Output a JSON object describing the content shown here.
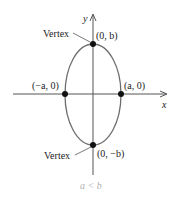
{
  "diagram": {
    "type": "ellipse-vertical-major-axis",
    "axes": {
      "x_label": "x",
      "y_label": "y"
    },
    "ellipse": {
      "stroke_color": "#6e6e6e"
    },
    "points": [
      {
        "id": "top",
        "label": "(0, b)"
      },
      {
        "id": "bottom",
        "label": "(0, −b)"
      },
      {
        "id": "left",
        "label": "(−a, 0)"
      },
      {
        "id": "right",
        "label": "(a, 0)"
      }
    ],
    "vertex_labels": {
      "top": "Vertex",
      "bottom": "Vertex"
    },
    "caption": "a < b",
    "colors": {
      "axis": "#555555",
      "point": "#111111",
      "text": "#222222",
      "caption": "#b0b0b0"
    }
  }
}
